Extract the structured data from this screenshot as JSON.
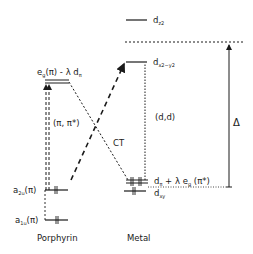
{
  "diagram": {
    "columns": {
      "left": "Porphyrin",
      "right": "Metal"
    },
    "levels": {
      "eg_mix": {
        "main": "e",
        "sub": "g",
        "rest": "(π) - λ d",
        "sub2": "π"
      },
      "a2u": {
        "main": "a",
        "sub": "2u",
        "rest": "(π)"
      },
      "a1u": {
        "main": "a",
        "sub": "1u",
        "rest": "(π)"
      },
      "dz2": {
        "main": "d",
        "sub": "z2"
      },
      "dx2y2": {
        "main": "d",
        "sub": "x2−y2"
      },
      "dpi_mix": {
        "main": "d",
        "sub": "π",
        "rest": " + λ e",
        "sub2": "g",
        "rest2": " (π*)"
      },
      "dxy": {
        "main": "d",
        "sub": "xy"
      }
    },
    "transitions": {
      "pipi": "(π, π*)",
      "dd": "(d,d)",
      "ct": "CT",
      "delta": "Δ"
    },
    "colors": {
      "ink": "#1a1a1a",
      "background": "#ffffff"
    }
  }
}
